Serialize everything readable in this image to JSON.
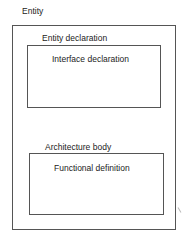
{
  "diagram": {
    "title": "Entity",
    "entity_box": {
      "sections": [
        {
          "label": "Entity declaration",
          "content": "Interface declaration"
        },
        {
          "label": "Architecture body",
          "content": "Functional definition"
        }
      ]
    }
  }
}
